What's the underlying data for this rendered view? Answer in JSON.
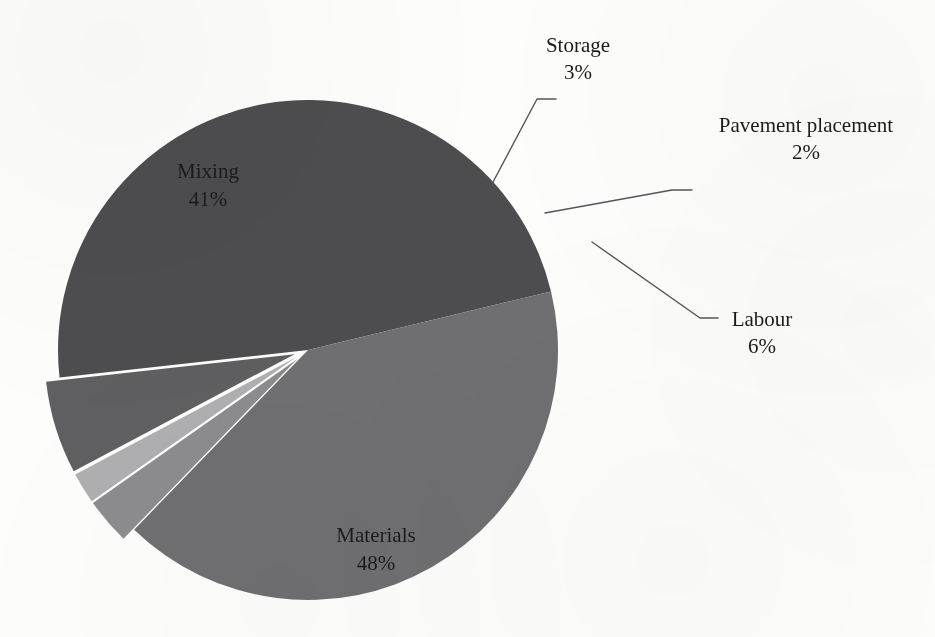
{
  "figure": {
    "background_color": "#fdfdfc",
    "width": 935,
    "height": 637
  },
  "chart_data": {
    "type": "pie",
    "title": "",
    "subtitle": "",
    "xlabel": "",
    "ylabel": "",
    "legend_position": "none",
    "grid": false,
    "labels_show_percent": true,
    "categories": [
      "Materials",
      "Mixing",
      "Storage",
      "Pavement placement",
      "Labour"
    ],
    "values": [
      48,
      41,
      3,
      2,
      6
    ],
    "units": "percent",
    "total": 100,
    "colors": [
      "#4d4d4f",
      "#6f6f71",
      "#8c8c8e",
      "#afafb1",
      "#5f5f61"
    ],
    "exploded": [
      false,
      false,
      true,
      true,
      true
    ],
    "slices": [
      {
        "name": "Materials",
        "value": 48,
        "label": "Materials",
        "percent_label": "48%",
        "color": "#4d4d4f",
        "exploded": false,
        "label_placement": "inside"
      },
      {
        "name": "Mixing",
        "value": 41,
        "label": "Mixing",
        "percent_label": "41%",
        "color": "#6f6f71",
        "exploded": false,
        "label_placement": "inside"
      },
      {
        "name": "Storage",
        "value": 3,
        "label": "Storage",
        "percent_label": "3%",
        "color": "#8c8c8e",
        "exploded": true,
        "label_placement": "callout"
      },
      {
        "name": "Pavement placement",
        "value": 2,
        "label": "Pavement placement",
        "percent_label": "2%",
        "color": "#afafb1",
        "exploded": true,
        "label_placement": "callout"
      },
      {
        "name": "Labour",
        "value": 6,
        "label": "Labour",
        "percent_label": "6%",
        "color": "#5f5f61",
        "exploded": true,
        "label_placement": "callout"
      }
    ]
  },
  "labels": {
    "mixing_name": "Mixing",
    "mixing_pct": "41%",
    "materials_name": "Materials",
    "materials_pct": "48%",
    "storage_name": "Storage",
    "storage_pct": "3%",
    "pavement_name": "Pavement placement",
    "pavement_pct": "2%",
    "labour_name": "Labour",
    "labour_pct": "6%"
  }
}
